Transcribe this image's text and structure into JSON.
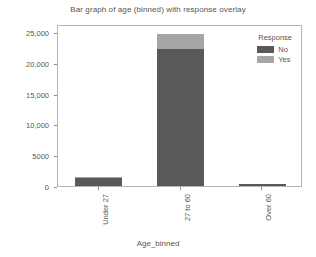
{
  "chart_data": {
    "type": "bar",
    "subtype": "stacked-bar",
    "title": "Bar graph of age (binned) with response overlay",
    "xlabel": "Age_binned",
    "ylabel": "",
    "categories": [
      "Under 27",
      "27 to 60",
      "Over 60"
    ],
    "series": [
      {
        "name": "No",
        "color": "#595959",
        "values": [
          1250,
          22200,
          370
        ]
      },
      {
        "name": "Yes",
        "color": "#a6a6a6",
        "values": [
          180,
          2500,
          40
        ]
      }
    ],
    "totals": [
      1430,
      24700,
      410
    ],
    "ylim": [
      0,
      26300
    ],
    "yticks": [
      0,
      5000,
      10000,
      15000,
      20000,
      25000
    ],
    "ytick_labels": [
      "0",
      "5000",
      "10,000",
      "15,000",
      "20,000",
      "25,000"
    ],
    "grid": false,
    "legend": {
      "title": "Response",
      "position": "top-right-inside",
      "entries": [
        {
          "label": "No",
          "color": "#595959"
        },
        {
          "label": "Yes",
          "color": "#a6a6a6"
        }
      ]
    },
    "axis_color": "#b5b5b5",
    "text_color": "#555555",
    "background": "#ffffff"
  }
}
